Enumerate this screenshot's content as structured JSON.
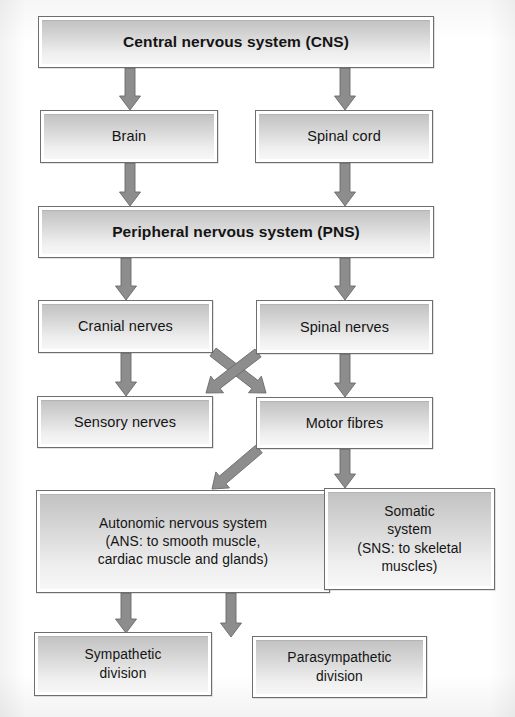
{
  "diagram": {
    "type": "flowchart",
    "background_color": "#ffffff",
    "box_fill_top": "#c3c3c3",
    "box_fill_bottom": "#f7f7f7",
    "box_border_color": "#6e6e6e",
    "arrow_color": "#8d8d8d",
    "arrow_border_color": "#6a6a6a",
    "text_color": "#141414"
  },
  "nodes": [
    {
      "id": "cns",
      "label": "Central nervous system (CNS)",
      "bold": true,
      "x": 38,
      "y": 16,
      "w": 396,
      "h": 52
    },
    {
      "id": "brain",
      "label": "Brain",
      "bold": false,
      "x": 40,
      "y": 110,
      "w": 178,
      "h": 53
    },
    {
      "id": "spinal-cord",
      "label": "Spinal cord",
      "bold": false,
      "x": 255,
      "y": 110,
      "w": 178,
      "h": 53
    },
    {
      "id": "pns",
      "label": "Peripheral nervous system (PNS)",
      "bold": true,
      "x": 38,
      "y": 206,
      "w": 396,
      "h": 52
    },
    {
      "id": "cranial-nerves",
      "label": "Cranial nerves",
      "bold": false,
      "x": 38,
      "y": 300,
      "w": 175,
      "h": 53
    },
    {
      "id": "spinal-nerves",
      "label": "Spinal nerves",
      "bold": false,
      "x": 256,
      "y": 300,
      "w": 177,
      "h": 54
    },
    {
      "id": "sensory-nerves",
      "label": "Sensory nerves",
      "bold": false,
      "x": 37,
      "y": 396,
      "w": 176,
      "h": 52
    },
    {
      "id": "motor-fibres",
      "label": "Motor fibres",
      "bold": false,
      "x": 256,
      "y": 397,
      "w": 177,
      "h": 52
    },
    {
      "id": "ans",
      "label": "Autonomic nervous system\n(ANS: to smooth muscle,\ncardiac muscle and glands)",
      "bold": false,
      "x": 36,
      "y": 490,
      "w": 294,
      "h": 103,
      "multi": true
    },
    {
      "id": "somatic",
      "label": "Somatic\nsystem\n(SNS: to skeletal\nmuscles)",
      "bold": false,
      "x": 324,
      "y": 488,
      "w": 171,
      "h": 102,
      "multi": true
    },
    {
      "id": "sympathetic",
      "label": "Sympathetic\ndivision",
      "bold": false,
      "x": 34,
      "y": 632,
      "w": 178,
      "h": 64,
      "multi": true
    },
    {
      "id": "parasympathetic",
      "label": "Parasympathetic\ndivision",
      "bold": false,
      "x": 252,
      "y": 636,
      "w": 175,
      "h": 62,
      "multi": true
    }
  ],
  "arrows": [
    {
      "id": "cns-to-brain",
      "from": "cns",
      "to": "brain",
      "kind": "vertical",
      "x1": 130,
      "y1": 68,
      "x2": 130,
      "y2": 110
    },
    {
      "id": "cns-to-spinal-cord",
      "from": "cns",
      "to": "spinal-cord",
      "kind": "vertical",
      "x1": 345,
      "y1": 68,
      "x2": 345,
      "y2": 110
    },
    {
      "id": "brain-to-pns",
      "from": "brain",
      "to": "pns",
      "kind": "vertical",
      "x1": 130,
      "y1": 163,
      "x2": 130,
      "y2": 206
    },
    {
      "id": "spinal-cord-to-pns",
      "from": "spinal-cord",
      "to": "pns",
      "kind": "vertical",
      "x1": 345,
      "y1": 163,
      "x2": 345,
      "y2": 206
    },
    {
      "id": "pns-to-cranial-nerves",
      "from": "pns",
      "to": "cranial-nerves",
      "kind": "vertical",
      "x1": 126,
      "y1": 258,
      "x2": 126,
      "y2": 300
    },
    {
      "id": "pns-to-spinal-nerves",
      "from": "pns",
      "to": "spinal-nerves",
      "kind": "vertical",
      "x1": 345,
      "y1": 258,
      "x2": 345,
      "y2": 300
    },
    {
      "id": "cranial-to-sensory",
      "from": "cranial-nerves",
      "to": "sensory-nerves",
      "kind": "vertical",
      "x1": 126,
      "y1": 353,
      "x2": 126,
      "y2": 396
    },
    {
      "id": "spinal-nerves-to-motor",
      "from": "spinal-nerves",
      "to": "motor-fibres",
      "kind": "vertical",
      "x1": 345,
      "y1": 354,
      "x2": 345,
      "y2": 397
    },
    {
      "id": "cranial-to-motor",
      "from": "cranial-nerves",
      "to": "motor-fibres",
      "kind": "diagonal",
      "x1": 213,
      "y1": 352,
      "x2": 266,
      "y2": 393
    },
    {
      "id": "spinal-nerves-to-sensory",
      "from": "spinal-nerves",
      "to": "sensory-nerves",
      "kind": "diagonal",
      "x1": 258,
      "y1": 353,
      "x2": 206,
      "y2": 393
    },
    {
      "id": "motor-to-ans",
      "from": "motor-fibres",
      "to": "ans",
      "kind": "diagonal",
      "x1": 259,
      "y1": 449,
      "x2": 212,
      "y2": 489
    },
    {
      "id": "motor-to-somatic",
      "from": "motor-fibres",
      "to": "somatic",
      "kind": "vertical",
      "x1": 345,
      "y1": 449,
      "x2": 345,
      "y2": 488
    },
    {
      "id": "ans-to-sympathetic",
      "from": "ans",
      "to": "sympathetic",
      "kind": "vertical",
      "x1": 126,
      "y1": 593,
      "x2": 126,
      "y2": 633
    },
    {
      "id": "ans-to-parasympathetic",
      "from": "ans",
      "to": "parasympathetic",
      "kind": "vertical",
      "x1": 231,
      "y1": 593,
      "x2": 231,
      "y2": 637
    }
  ]
}
